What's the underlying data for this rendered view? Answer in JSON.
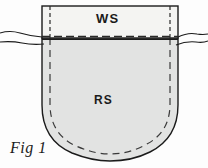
{
  "figure": {
    "caption": "Fig 1",
    "labels": {
      "wrong_side": "WS",
      "right_side": "RS"
    },
    "colors": {
      "background": "#fdfdfd",
      "facing_fill": "#f2f2f0",
      "pocket_fill": "#e2e3e2",
      "outline": "#1b1b1b",
      "stitch_line": "#2a2a2a",
      "text": "#1b1b1b"
    },
    "parts": [
      {
        "name": "facing-band",
        "label": "WS",
        "description": "Top rectangular facing band shown wrong side up"
      },
      {
        "name": "pocket-body",
        "label": "RS",
        "description": "Lower U-shaped pocket body shown right side up"
      }
    ],
    "guides": [
      {
        "name": "fold-seam-line",
        "style": "dashed-horizontal"
      },
      {
        "name": "left-seam-allowance-line",
        "style": "dashed-vertical"
      },
      {
        "name": "right-seam-allowance-line",
        "style": "dashed-vertical"
      },
      {
        "name": "pocket-seam-allowance",
        "style": "dashed-curve"
      },
      {
        "name": "left-fabric-edge",
        "style": "wavy"
      },
      {
        "name": "right-fabric-edge",
        "style": "wavy"
      }
    ]
  }
}
